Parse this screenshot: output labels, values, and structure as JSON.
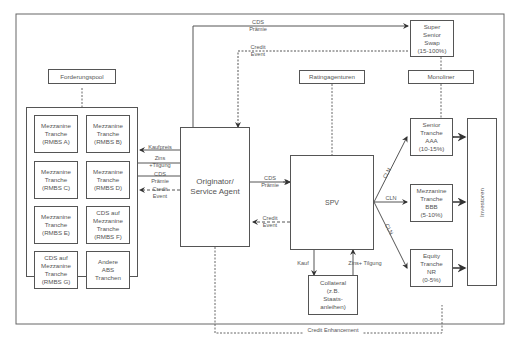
{
  "diagram": {
    "pool_label": "Forderungspool",
    "pool_items": [
      "Mezzanine\nTranche\n(RMBS A)",
      "Mezzanine\nTranche\n(RMBS B)",
      "Mezzanine\nTranche\n(RMBS C)",
      "Mezzanine\nTranche\n(RMBS D)",
      "Mezzanine\nTranche\n(RMBS E)",
      "CDS auf\nMezzanine\nTranche\n(RMBS F)",
      "CDS auf\nMezzanine\nTranche\n(RMBS G)",
      "Andere\nABS\nTranchen"
    ],
    "originator": "Originator/\nService Agent",
    "spv": "SPV",
    "collateral": "Collateral\n(z.B.\nStaats-\nanleihen)",
    "rating": "Ratingagenturen",
    "monoliner": "Monoliner",
    "super_senior": "Super\nSenior\nSwap\n(15-100%)",
    "tranches": [
      "Senior\nTranche\nAAA\n(10-15%)",
      "Mezzanine\nTranche\nBBB\n(5-10%)",
      "Equity\nTranche\nNR\n(0-5%)"
    ],
    "investors": "Investoren",
    "flows": {
      "kaufpreis": "Kaufpreis",
      "zins_tilgung_left": "Zins\n+Tilgung",
      "cds_praemie_left": "CDS\nPrämie",
      "credit_event_left": "Credit\nEvent",
      "cds_praemie_mid": "CDS\nPrämie",
      "credit_event_mid": "Credit\nEvent",
      "cds_praemie_top": "CDS\nPrämie",
      "credit_event_top": "Credit\nEvent",
      "kauf": "Kauf",
      "zins_tilgung_bottom": "Zins+ Tilgung",
      "cln": "CLN",
      "credit_enhancement": "Credit Enhancement"
    }
  }
}
